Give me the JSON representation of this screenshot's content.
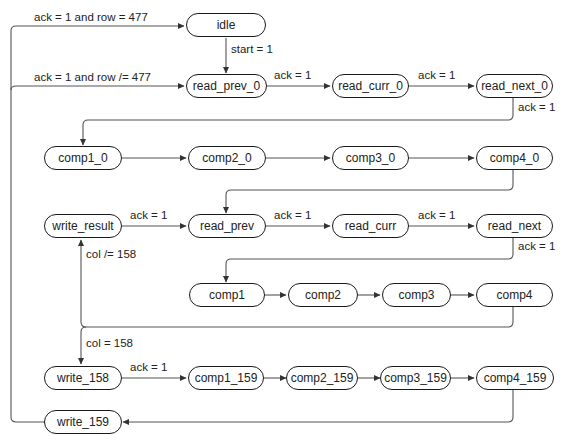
{
  "diagram": {
    "type": "state-machine",
    "colors": {
      "stroke": "#1a1a1a",
      "edge": "#555555",
      "text": "#222222",
      "background": "#ffffff"
    },
    "nodes": {
      "idle": "idle",
      "read_prev_0": "read_prev_0",
      "read_curr_0": "read_curr_0",
      "read_next_0": "read_next_0",
      "comp1_0": "comp1_0",
      "comp2_0": "comp2_0",
      "comp3_0": "comp3_0",
      "comp4_0": "comp4_0",
      "write_result": "write_result",
      "read_prev": "read_prev",
      "read_curr": "read_curr",
      "read_next": "read_next",
      "comp1": "comp1",
      "comp2": "comp2",
      "comp3": "comp3",
      "comp4": "comp4",
      "write_158": "write_158",
      "comp1_159": "comp1_159",
      "comp2_159": "comp2_159",
      "comp3_159": "comp3_159",
      "comp4_159": "comp4_159",
      "write_159": "write_159"
    },
    "edge_labels": {
      "write159_to_idle": "ack = 1 and row = 477",
      "write159_to_read_prev_0": "ack = 1 and row /= 477",
      "idle_to_read_prev_0": "start = 1",
      "read_prev_0_to_read_curr_0": "ack = 1",
      "read_curr_0_to_read_next_0": "ack = 1",
      "read_next_0_to_comp1_0": "ack = 1",
      "write_result_to_read_prev": "ack = 1",
      "read_prev_to_read_curr": "ack = 1",
      "read_curr_to_read_next": "ack = 1",
      "read_next_to_comp1": "ack = 1",
      "comp4_to_write_result": "col /= 158",
      "comp4_to_write_158": "col = 158",
      "write_158_to_comp1_159": "ack = 1"
    }
  }
}
